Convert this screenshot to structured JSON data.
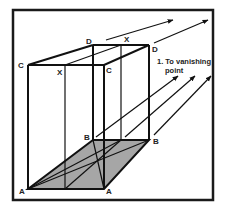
{
  "diagram": {
    "type": "perspective-box-construction",
    "colors": {
      "background": "#ffffff",
      "line": "#111111",
      "shade": "#a6a6a6",
      "frame": "#1a1a1a"
    },
    "labels": {
      "c_left": "C",
      "c_right": "C",
      "d_left": "D",
      "d_right": "D",
      "x_front": "X",
      "x_back": "X",
      "b_left": "B",
      "b_right": "B",
      "a_left": "A",
      "a_right": "A"
    },
    "annotation": {
      "line1": "1. To vanishing",
      "line2": "point"
    }
  }
}
